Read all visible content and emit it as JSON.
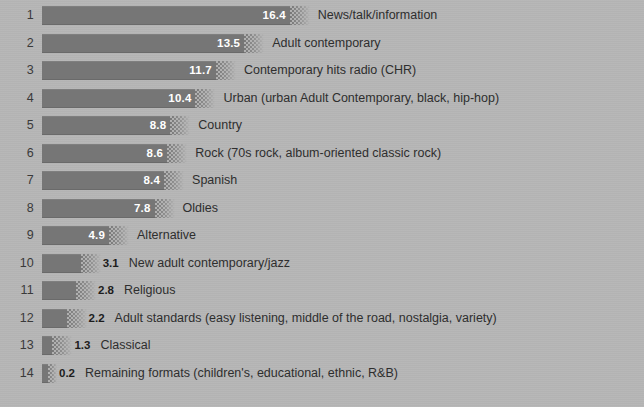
{
  "chart_data": {
    "type": "bar",
    "orientation": "horizontal",
    "title": "",
    "subtitle": "",
    "xlabel": "",
    "ylabel": "",
    "grid": false,
    "legend": null,
    "xlim": [
      0,
      16.4
    ],
    "value_suffix": "",
    "categories": [
      "News/talk/information",
      "Adult contemporary",
      "Contemporary hits radio (CHR)",
      "Urban (urban Adult Contemporary, black, hip-hop)",
      "Country",
      "Rock (70s rock, album-oriented classic rock)",
      "Spanish",
      "Oldies",
      "Alternative",
      "New adult contemporary/jazz",
      "Religious",
      "Adult standards (easy listening, middle of the road, nostalgia, variety)",
      "Classical",
      "Remaining formats (children's, educational, ethnic, R&B)"
    ],
    "values": [
      16.4,
      13.5,
      11.7,
      10.4,
      8.8,
      8.6,
      8.4,
      7.8,
      4.9,
      3.1,
      2.8,
      2.2,
      1.3,
      0.2
    ],
    "ranks": [
      "1",
      "2",
      "3",
      "4",
      "5",
      "6",
      "7",
      "8",
      "9",
      "10",
      "11",
      "12",
      "13",
      "14"
    ]
  },
  "colors": {
    "background": "#b6b6b6",
    "bar": "#767676",
    "value_text_inside": "#ffffff",
    "value_text_outside": "#1d1d1d",
    "label_text": "#2e2e2e",
    "rank_text": "#3a3a3a"
  },
  "rows": [
    {
      "rank": "1",
      "value": "16.4",
      "label": "News/talk/information"
    },
    {
      "rank": "2",
      "value": "13.5",
      "label": "Adult contemporary"
    },
    {
      "rank": "3",
      "value": "11.7",
      "label": "Contemporary hits radio (CHR)"
    },
    {
      "rank": "4",
      "value": "10.4",
      "label": "Urban (urban Adult Contemporary, black, hip-hop)"
    },
    {
      "rank": "5",
      "value": "8.8",
      "label": "Country"
    },
    {
      "rank": "6",
      "value": "8.6",
      "label": "Rock (70s rock, album-oriented classic rock)"
    },
    {
      "rank": "7",
      "value": "8.4",
      "label": "Spanish"
    },
    {
      "rank": "8",
      "value": "7.8",
      "label": "Oldies"
    },
    {
      "rank": "9",
      "value": "4.9",
      "label": "Alternative"
    },
    {
      "rank": "10",
      "value": "3.1",
      "label": "New adult contemporary/jazz"
    },
    {
      "rank": "11",
      "value": "2.8",
      "label": "Religious"
    },
    {
      "rank": "12",
      "value": "2.2",
      "label": "Adult standards (easy listening, middle of the road, nostalgia, variety)"
    },
    {
      "rank": "13",
      "value": "1.3",
      "label": "Classical"
    },
    {
      "rank": "14",
      "value": "0.2",
      "label": "Remaining formats (children's, educational, ethnic, R&B)"
    }
  ]
}
